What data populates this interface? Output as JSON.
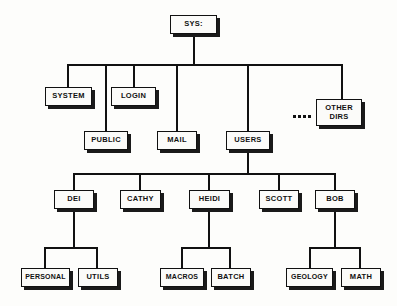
{
  "diagram": {
    "type": "directory-tree",
    "ellipsis_label": "....",
    "colors": {
      "background": "#fdfdfb",
      "box_fill": "#fbfbf9",
      "line": "#111111",
      "shadow": "#1a1a1a"
    },
    "nodes": [
      {
        "id": "sys",
        "label": "SYS:",
        "level": 0,
        "x": 170,
        "y": 15,
        "w": 47,
        "h": 19
      },
      {
        "id": "system",
        "label": "SYSTEM",
        "level": 1,
        "x": 45,
        "y": 87,
        "w": 47,
        "h": 19
      },
      {
        "id": "login",
        "label": "LOGIN",
        "level": 1,
        "x": 111,
        "y": 87,
        "w": 45,
        "h": 19
      },
      {
        "id": "public",
        "label": "PUBLIC",
        "level": 1,
        "x": 84,
        "y": 131,
        "w": 44,
        "h": 19
      },
      {
        "id": "mail",
        "label": "MAIL",
        "level": 1,
        "x": 157,
        "y": 131,
        "w": 40,
        "h": 19
      },
      {
        "id": "users",
        "label": "USERS",
        "level": 1,
        "x": 226,
        "y": 131,
        "w": 44,
        "h": 19
      },
      {
        "id": "other",
        "label": "OTHER\nDIRS",
        "level": 1,
        "x": 316,
        "y": 99,
        "w": 46,
        "h": 27
      },
      {
        "id": "dei",
        "label": "DEI",
        "level": 2,
        "x": 54,
        "y": 190,
        "w": 40,
        "h": 19
      },
      {
        "id": "cathy",
        "label": "CATHY",
        "level": 2,
        "x": 120,
        "y": 190,
        "w": 41,
        "h": 19
      },
      {
        "id": "heidi",
        "label": "HEIDI",
        "level": 2,
        "x": 189,
        "y": 190,
        "w": 41,
        "h": 19
      },
      {
        "id": "scott",
        "label": "SCOTT",
        "level": 2,
        "x": 259,
        "y": 190,
        "w": 40,
        "h": 19
      },
      {
        "id": "bob",
        "label": "BOB",
        "level": 2,
        "x": 315,
        "y": 190,
        "w": 40,
        "h": 19
      },
      {
        "id": "personal",
        "label": "PERSONAL",
        "level": 3,
        "x": 21,
        "y": 268,
        "w": 49,
        "h": 19
      },
      {
        "id": "utils",
        "label": "UTILS",
        "level": 3,
        "x": 78,
        "y": 268,
        "w": 40,
        "h": 19
      },
      {
        "id": "macros",
        "label": "MACROS",
        "level": 3,
        "x": 160,
        "y": 268,
        "w": 44,
        "h": 19
      },
      {
        "id": "batch",
        "label": "BATCH",
        "level": 3,
        "x": 211,
        "y": 268,
        "w": 40,
        "h": 19
      },
      {
        "id": "geology",
        "label": "GEOLOGY",
        "level": 3,
        "x": 286,
        "y": 268,
        "w": 47,
        "h": 19
      },
      {
        "id": "math",
        "label": "MATH",
        "level": 3,
        "x": 341,
        "y": 268,
        "w": 40,
        "h": 19
      }
    ],
    "edges": [
      {
        "from": "sys",
        "to": "system"
      },
      {
        "from": "sys",
        "to": "public"
      },
      {
        "from": "sys",
        "to": "login"
      },
      {
        "from": "sys",
        "to": "mail"
      },
      {
        "from": "sys",
        "to": "users"
      },
      {
        "from": "sys",
        "to": "other"
      },
      {
        "from": "users",
        "to": "dei"
      },
      {
        "from": "users",
        "to": "cathy"
      },
      {
        "from": "users",
        "to": "heidi"
      },
      {
        "from": "users",
        "to": "scott"
      },
      {
        "from": "users",
        "to": "bob"
      },
      {
        "from": "dei",
        "to": "personal"
      },
      {
        "from": "dei",
        "to": "utils"
      },
      {
        "from": "heidi",
        "to": "macros"
      },
      {
        "from": "heidi",
        "to": "batch"
      },
      {
        "from": "bob",
        "to": "geology"
      },
      {
        "from": "bob",
        "to": "math"
      }
    ]
  }
}
